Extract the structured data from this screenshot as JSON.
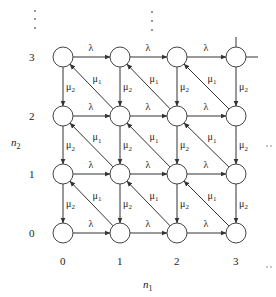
{
  "axes": {
    "x_label": "n",
    "x_label_sub": "1",
    "y_label": "n",
    "y_label_sub": "2",
    "x_ticks": [
      "0",
      "1",
      "2",
      "3"
    ],
    "y_ticks": [
      "0",
      "1",
      "2",
      "3"
    ]
  },
  "rates": {
    "arrival": "λ",
    "service1": "μ",
    "service1_sub": "1",
    "service2": "μ",
    "service2_sub": "2"
  },
  "continuation": "⋯",
  "grid": {
    "cols": [
      63,
      120,
      177,
      236
    ],
    "rows": [
      233,
      174,
      116,
      57
    ],
    "radius": 10
  }
}
